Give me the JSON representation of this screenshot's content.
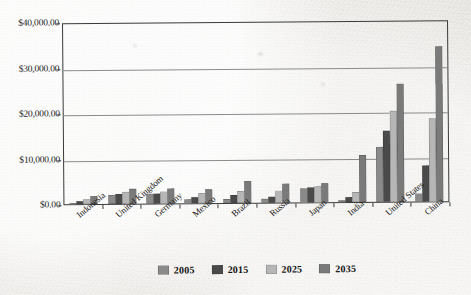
{
  "chart_data": {
    "type": "bar",
    "title": "",
    "xlabel": "",
    "ylabel": "",
    "ylim": [
      0,
      40000
    ],
    "grid": true,
    "legend_position": "bottom",
    "y_tick_labels": [
      "$40,000.00",
      "$30,000.00",
      "$20,000.00",
      "$10,000.00",
      "$0.00"
    ],
    "y_ticks": [
      40000,
      30000,
      20000,
      10000,
      0
    ],
    "categories": [
      "Indonesia",
      "United Kingdom",
      "Germany",
      "Mexico",
      "Brazil",
      "Russia",
      "Japan",
      "India",
      "United States",
      "China"
    ],
    "series": [
      {
        "name": "2005",
        "color": "#8a8a8a",
        "values": [
          200,
          1900,
          2100,
          900,
          900,
          800,
          3100,
          500,
          12000,
          1800
        ]
      },
      {
        "name": "2015",
        "color": "#4a4a4a",
        "values": [
          700,
          2100,
          2200,
          1400,
          1700,
          1400,
          3200,
          1200,
          15600,
          7900
        ]
      },
      {
        "name": "2025",
        "color": "#b6b6b6",
        "values": [
          1100,
          2600,
          2700,
          2300,
          2700,
          2600,
          3500,
          2200,
          20100,
          18200
        ]
      },
      {
        "name": "2035",
        "color": "#7a7a7a",
        "values": [
          1700,
          3200,
          3300,
          3100,
          4800,
          4100,
          4200,
          10400,
          26000,
          34000
        ]
      }
    ]
  },
  "legend": {
    "entries": [
      {
        "label": "2005"
      },
      {
        "label": "2015"
      },
      {
        "label": "2025"
      },
      {
        "label": "2035"
      }
    ]
  }
}
